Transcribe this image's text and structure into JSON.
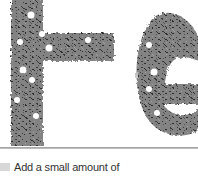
{
  "hero": {
    "image_alt": "te",
    "letter_color": "#7a7a7a",
    "speckle_color": "#3a3a3a"
  },
  "step": {
    "icon": "step-thumbnail-icon",
    "text": "Add a small amount of"
  }
}
